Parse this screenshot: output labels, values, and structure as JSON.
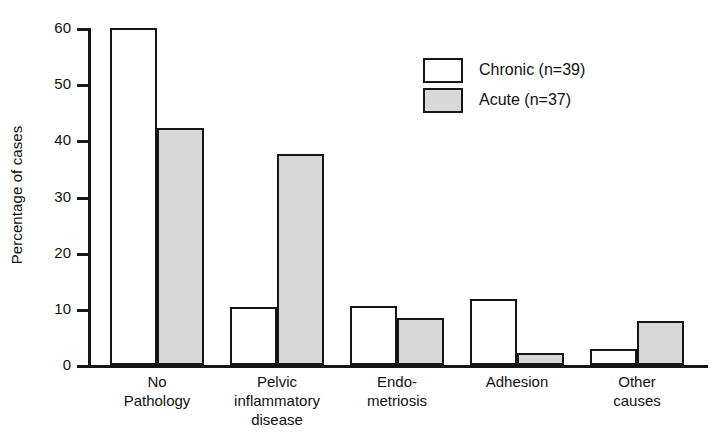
{
  "chart_data": {
    "type": "bar",
    "title": "",
    "xlabel": "",
    "ylabel": "Percentage of cases",
    "ylim": [
      0,
      60
    ],
    "yticks": [
      0,
      10,
      20,
      30,
      40,
      50,
      60
    ],
    "ytick_labels": [
      "0",
      "10",
      "20",
      "30",
      "40",
      "50",
      "60"
    ],
    "grid": false,
    "legend_position": "top-right",
    "categories": [
      "No\nPathology",
      "Pelvic\ninflammatory\ndisease",
      "Endo-\nmetriosis",
      "Adhesion",
      "Other\ncauses"
    ],
    "series": [
      {
        "name": "Chronic (n=39)",
        "short_name": "Chronic",
        "n": 39,
        "color": "#ffffff",
        "edge_color": "#161616",
        "values": [
          60.0,
          10.3,
          10.5,
          11.8,
          2.8
        ]
      },
      {
        "name": "Acute (n=37)",
        "short_name": "Acute",
        "n": 37,
        "color": "#d8d8d8",
        "edge_color": "#161616",
        "values": [
          42.2,
          37.6,
          8.3,
          2.2,
          7.8
        ]
      }
    ]
  },
  "legend": {
    "items": [
      {
        "label": "Chronic (n=39)",
        "swatch": "chronic"
      },
      {
        "label": "Acute (n=37)",
        "swatch": "acute"
      }
    ]
  },
  "axis": {
    "y_title": "Percentage of cases",
    "tick_labels": [
      "60",
      "50",
      "40",
      "30",
      "20",
      "10",
      "0"
    ]
  },
  "categories_display": [
    "No\nPathology",
    "Pelvic\ninflammatory\ndisease",
    "Endo-\nmetriosis",
    "Adhesion",
    "Other\ncauses"
  ]
}
